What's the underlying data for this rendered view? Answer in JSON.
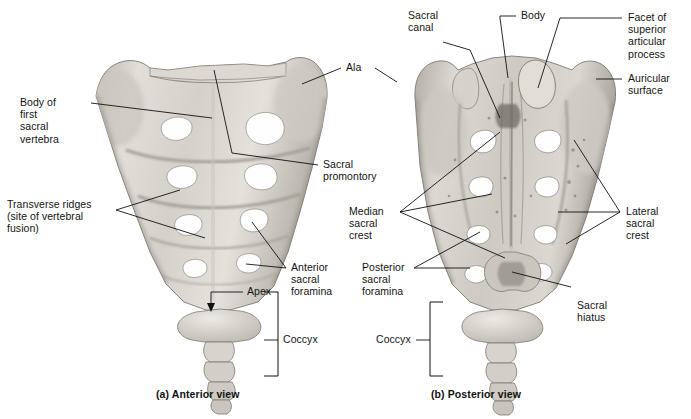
{
  "figure": {
    "background": "#ffffff",
    "ink": "#111111",
    "bone_light": "#e9e6e0",
    "bone_mid": "#c9c4bb",
    "bone_dark": "#8e8a82"
  },
  "panels": [
    {
      "id": "a",
      "caption": "(a) Anterior view"
    },
    {
      "id": "b",
      "caption": "(b) Posterior view"
    }
  ],
  "anterior": {
    "caption": "(a) Anterior view",
    "labels": [
      {
        "name": "body-of-first-sacral-vertebra",
        "text": "Body of\nfirst\nsacral\nvertebra",
        "align": "left"
      },
      {
        "name": "transverse-ridges",
        "text": "Transverse ridges\n(site of vertebral\nfusion)",
        "align": "left"
      },
      {
        "name": "ala",
        "text": "Ala",
        "align": "left"
      },
      {
        "name": "sacral-promontory",
        "text": "Sacral\npromontory",
        "align": "left"
      },
      {
        "name": "anterior-sacral-foramina",
        "text": "Anterior\nsacral\nforamina",
        "align": "left"
      },
      {
        "name": "apex",
        "text": "Apex",
        "align": "right"
      },
      {
        "name": "coccyx",
        "text": "Coccyx",
        "align": "left"
      }
    ]
  },
  "posterior": {
    "caption": "(b) Posterior view",
    "labels": [
      {
        "name": "sacral-canal",
        "text": "Sacral\ncanal",
        "align": "left"
      },
      {
        "name": "body",
        "text": "Body",
        "align": "left"
      },
      {
        "name": "facet-of-superior-articular-process",
        "text": "Facet of\nsuperior\narticular\nprocess",
        "align": "left"
      },
      {
        "name": "auricular-surface",
        "text": "Auricular\nsurface",
        "align": "left"
      },
      {
        "name": "median-sacral-crest",
        "text": "Median\nsacral\ncrest",
        "align": "left"
      },
      {
        "name": "lateral-sacral-crest",
        "text": "Lateral\nsacral\ncrest",
        "align": "left"
      },
      {
        "name": "posterior-sacral-foramina",
        "text": "Posterior\nsacral\nforamina",
        "align": "left"
      },
      {
        "name": "sacral-hiatus",
        "text": "Sacral\nhiatus",
        "align": "left"
      },
      {
        "name": "coccyx",
        "text": "Coccyx",
        "align": "right"
      }
    ]
  }
}
